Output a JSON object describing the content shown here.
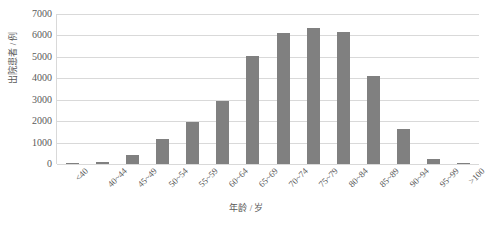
{
  "chart_data": {
    "type": "bar",
    "title": "",
    "xlabel": "年龄 / 岁",
    "ylabel": "出院患者 / 例",
    "categories": [
      "<40",
      "40~44",
      "45~49",
      "50~54",
      "55~59",
      "60~64",
      "65~69",
      "70~74",
      "75~79",
      "80~84",
      "85~89",
      "90~94",
      "95~99",
      ">100"
    ],
    "values": [
      60,
      110,
      420,
      1180,
      1950,
      2950,
      5050,
      6100,
      6350,
      6150,
      4100,
      1650,
      250,
      30
    ],
    "ylim": [
      0,
      7000
    ],
    "yticks": [
      0,
      1000,
      2000,
      3000,
      4000,
      5000,
      6000,
      7000
    ],
    "ytick_labels": [
      "0",
      "1000",
      "2000",
      "3000",
      "4000",
      "5000",
      "6000",
      "7000"
    ],
    "grid": true,
    "legend": false,
    "bar_color": "#808080",
    "grid_color": "#d9d9d9",
    "text_color": "#595959"
  }
}
